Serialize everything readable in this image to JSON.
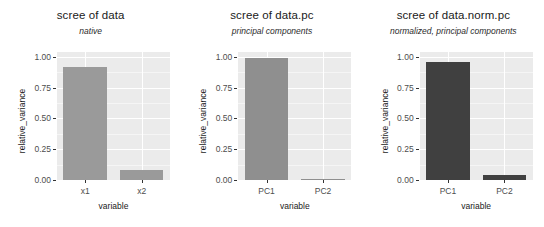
{
  "figure": {
    "background": "#ffffff",
    "panel_background": "#ebebeb",
    "gridline_color": "#ffffff",
    "axis_text_color": "#4d4d4d"
  },
  "chart_data": [
    {
      "type": "bar",
      "title": "scree of data",
      "subtitle": "native",
      "xlabel": "variable",
      "ylabel": "relative_variance",
      "categories": [
        "x1",
        "x2"
      ],
      "values": [
        0.915,
        0.085
      ],
      "ylim": [
        0.0,
        1.04
      ],
      "yticks": [
        "0.00",
        "0.25",
        "0.50",
        "0.75",
        "1.00"
      ],
      "ytick_values": [
        0.0,
        0.25,
        0.5,
        0.75,
        1.0
      ],
      "bar_color": "#9a9a9a",
      "grid": true,
      "legend": "none"
    },
    {
      "type": "bar",
      "title": "scree of data.pc",
      "subtitle": "principal components",
      "xlabel": "variable",
      "ylabel": "relative_variance",
      "categories": [
        "PC1",
        "PC2"
      ],
      "values": [
        0.995,
        0.005
      ],
      "ylim": [
        0.0,
        1.04
      ],
      "yticks": [
        "0.00",
        "0.25",
        "0.50",
        "0.75",
        "1.00"
      ],
      "ytick_values": [
        0.0,
        0.25,
        0.5,
        0.75,
        1.0
      ],
      "bar_color": "#8f8f8f",
      "grid": true,
      "legend": "none"
    },
    {
      "type": "bar",
      "title": "scree of data.norm.pc",
      "subtitle": "normalized, principal components",
      "xlabel": "variable",
      "ylabel": "relative_variance",
      "categories": [
        "PC1",
        "PC2"
      ],
      "values": [
        0.96,
        0.04
      ],
      "ylim": [
        0.0,
        1.04
      ],
      "yticks": [
        "0.00",
        "0.25",
        "0.50",
        "0.75",
        "1.00"
      ],
      "ytick_values": [
        0.0,
        0.25,
        0.5,
        0.75,
        1.0
      ],
      "bar_color": "#404040",
      "grid": true,
      "legend": "none"
    }
  ]
}
